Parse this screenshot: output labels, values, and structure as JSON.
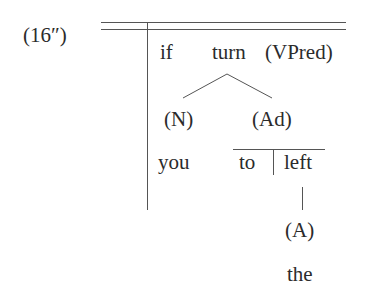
{
  "example_label": "(16″)",
  "diagram": {
    "row1": {
      "conj": "if",
      "verb": "turn",
      "verb_label": "(VPred)"
    },
    "row2": {
      "subject_label": "(N)",
      "adjunct_label": "(Ad)"
    },
    "row3": {
      "subject": "you",
      "prep": "to",
      "object": "left"
    },
    "row4": {
      "modifier_label": "(A)"
    },
    "row5": {
      "modifier": "the"
    }
  },
  "colors": {
    "text": "#2b2b2b",
    "lines": "#555555",
    "background": "#ffffff"
  }
}
